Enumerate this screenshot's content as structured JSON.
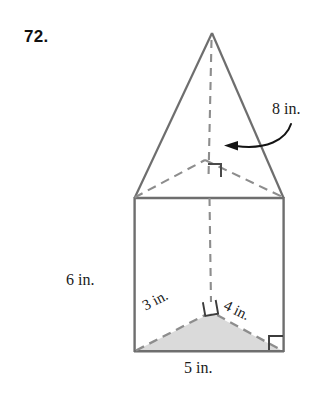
{
  "figure": {
    "problem_number": "72.",
    "solid_description": "triangular prism topped by a triangular pyramid",
    "labels": {
      "slant_height": "8 in.",
      "prism_height": "6 in.",
      "base_leg_left": "3 in.",
      "base_leg_right": "4 in.",
      "base_hypotenuse": "5 in."
    },
    "colors": {
      "outline": "#6e6e6e",
      "dashed": "#8a8a8a",
      "shade_fill": "#d9d9d9",
      "text": "#1a1a1a",
      "arrow": "#111111"
    },
    "marks": {
      "pyramid_right_angle": "right-angle-mark",
      "base_center_right_angle": "right-angle-mark",
      "base_corner_right_angle": "right-angle-mark"
    },
    "annotation_arrow": {
      "name": "curved-arrow-to-slant-edge",
      "points_to": "pyramid lateral edge"
    },
    "geometry": {
      "prism_left_x": 134,
      "prism_right_x": 284,
      "prism_top_y": 198,
      "prism_bottom_y": 352,
      "apex": [
        212,
        33
      ],
      "top_back_vertex": [
        205,
        160
      ],
      "bottom_back_vertex": [
        211,
        313
      ]
    }
  }
}
